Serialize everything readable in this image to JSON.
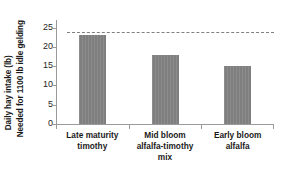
{
  "chart_data": {
    "type": "bar",
    "title": "",
    "subtitle": "",
    "xlabel": "",
    "ylabel": "Daily hay intake (lb) Needed for 1100 lb idle gelding",
    "ylabel_lines": [
      "Daily hay intake (lb)",
      "Needed for 1100 lb idle gelding"
    ],
    "categories": [
      "Late maturity timothy",
      "Mid bloom alfalfa-timothy mix",
      "Early bloom alfalfa"
    ],
    "category_lines": [
      [
        "Late maturity",
        "timothy"
      ],
      [
        "Mid bloom",
        "alfalfa-timothy",
        "mix"
      ],
      [
        "Early bloom",
        "alfalfa"
      ]
    ],
    "values": [
      23,
      18,
      15
    ],
    "ylim": [
      0,
      27
    ],
    "yticks": [
      0,
      5,
      10,
      15,
      20,
      25
    ],
    "ytick_labels": [
      "0",
      "5",
      "10",
      "15",
      "20",
      "25"
    ],
    "grid": false,
    "legend": "none",
    "annotations": [
      {
        "name": "reference-line",
        "type": "horizontal-dashed-line",
        "value": 24,
        "label": ""
      }
    ],
    "colors": {
      "bar_fill": "#7f7f7f",
      "axis": "#9a9a9a",
      "reference_line": "#808080",
      "text": "#1a1a1a",
      "background": "#ffffff"
    }
  }
}
